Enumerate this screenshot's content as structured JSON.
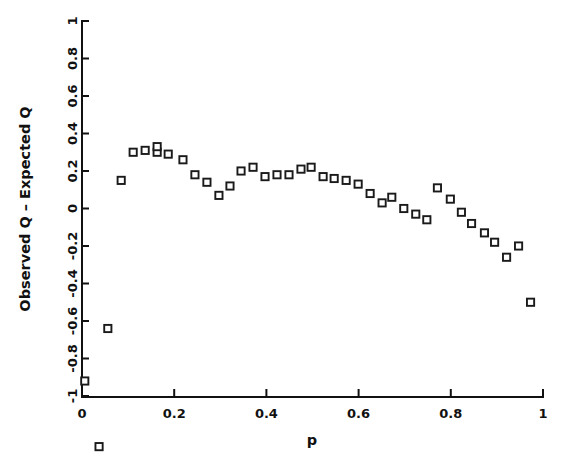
{
  "chart_data": {
    "type": "scatter",
    "title": "",
    "xlabel": "p",
    "ylabel": "Observed Q - Expected Q",
    "xlim": [
      0,
      1
    ],
    "ylim": [
      -1,
      1
    ],
    "grid": false,
    "legend": null,
    "marker": "open-square",
    "xticks": [
      0,
      0.2,
      0.4,
      0.6,
      0.8,
      1
    ],
    "xtick_labels": [
      "0",
      "0.2",
      "0.4",
      "0.6",
      "0.8",
      "1"
    ],
    "yticks": [
      -1,
      -0.8,
      -0.6,
      -0.4,
      -0.2,
      0,
      0.2,
      0.4,
      0.6,
      0.8,
      1
    ],
    "ytick_labels": [
      "-1",
      "-0.8",
      "-0.6",
      "-0.4",
      "-0.2",
      "0",
      "0.2",
      "0.4",
      "0.6",
      "0.8",
      "1"
    ],
    "points": [
      {
        "x": 0.006,
        "y": -0.92
      },
      {
        "x": 0.037,
        "y": -1.27
      },
      {
        "x": 0.056,
        "y": -0.64
      },
      {
        "x": 0.085,
        "y": 0.15
      },
      {
        "x": 0.111,
        "y": 0.3
      },
      {
        "x": 0.137,
        "y": 0.31
      },
      {
        "x": 0.163,
        "y": 0.3
      },
      {
        "x": 0.163,
        "y": 0.33
      },
      {
        "x": 0.187,
        "y": 0.29
      },
      {
        "x": 0.219,
        "y": 0.26
      },
      {
        "x": 0.245,
        "y": 0.18
      },
      {
        "x": 0.271,
        "y": 0.14
      },
      {
        "x": 0.297,
        "y": 0.07
      },
      {
        "x": 0.321,
        "y": 0.12
      },
      {
        "x": 0.345,
        "y": 0.2
      },
      {
        "x": 0.371,
        "y": 0.22
      },
      {
        "x": 0.397,
        "y": 0.17
      },
      {
        "x": 0.423,
        "y": 0.18
      },
      {
        "x": 0.449,
        "y": 0.18
      },
      {
        "x": 0.475,
        "y": 0.21
      },
      {
        "x": 0.497,
        "y": 0.22
      },
      {
        "x": 0.523,
        "y": 0.17
      },
      {
        "x": 0.547,
        "y": 0.16
      },
      {
        "x": 0.573,
        "y": 0.15
      },
      {
        "x": 0.599,
        "y": 0.13
      },
      {
        "x": 0.625,
        "y": 0.08
      },
      {
        "x": 0.651,
        "y": 0.03
      },
      {
        "x": 0.672,
        "y": 0.06
      },
      {
        "x": 0.698,
        "y": 0.0
      },
      {
        "x": 0.724,
        "y": -0.03
      },
      {
        "x": 0.748,
        "y": -0.06
      },
      {
        "x": 0.771,
        "y": 0.11
      },
      {
        "x": 0.799,
        "y": 0.05
      },
      {
        "x": 0.823,
        "y": -0.02
      },
      {
        "x": 0.845,
        "y": -0.08
      },
      {
        "x": 0.873,
        "y": -0.13
      },
      {
        "x": 0.895,
        "y": -0.18
      },
      {
        "x": 0.921,
        "y": -0.26
      },
      {
        "x": 0.947,
        "y": -0.2
      },
      {
        "x": 0.973,
        "y": -0.5
      }
    ]
  },
  "figure": {
    "x_axis_title": "p",
    "y_axis_title": "Observed Q – Expected Q"
  }
}
